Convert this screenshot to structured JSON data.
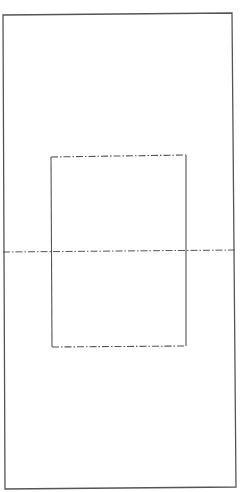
{
  "diagram": {
    "width": 245,
    "height": 492,
    "background": "#ffffff",
    "stroke_color": "#555555",
    "outer_frame": {
      "style": "solid",
      "points": [
        [
          3,
          15
        ],
        [
          232,
          13
        ],
        [
          236,
          487
        ],
        [
          5,
          489
        ]
      ],
      "stroke_width": 1.3
    },
    "inner_rect": {
      "left_side": {
        "style": "solid",
        "from": [
          51,
          157
        ],
        "to": [
          52,
          347
        ]
      },
      "right_side": {
        "style": "solid",
        "from": [
          186,
          155
        ],
        "to": [
          186,
          346
        ]
      },
      "top_edge": {
        "style": "dash-dot",
        "from": [
          51,
          157
        ],
        "to": [
          186,
          155
        ]
      },
      "bottom_edge": {
        "style": "dash-dot",
        "from": [
          52,
          347
        ],
        "to": [
          186,
          346
        ]
      },
      "stroke_width": 1.1
    },
    "centerline": {
      "style": "dash-dot",
      "from": [
        3,
        252
      ],
      "to": [
        236,
        250
      ],
      "stroke_width": 1.0
    },
    "dash_pattern": "7 2 1.5 2"
  }
}
